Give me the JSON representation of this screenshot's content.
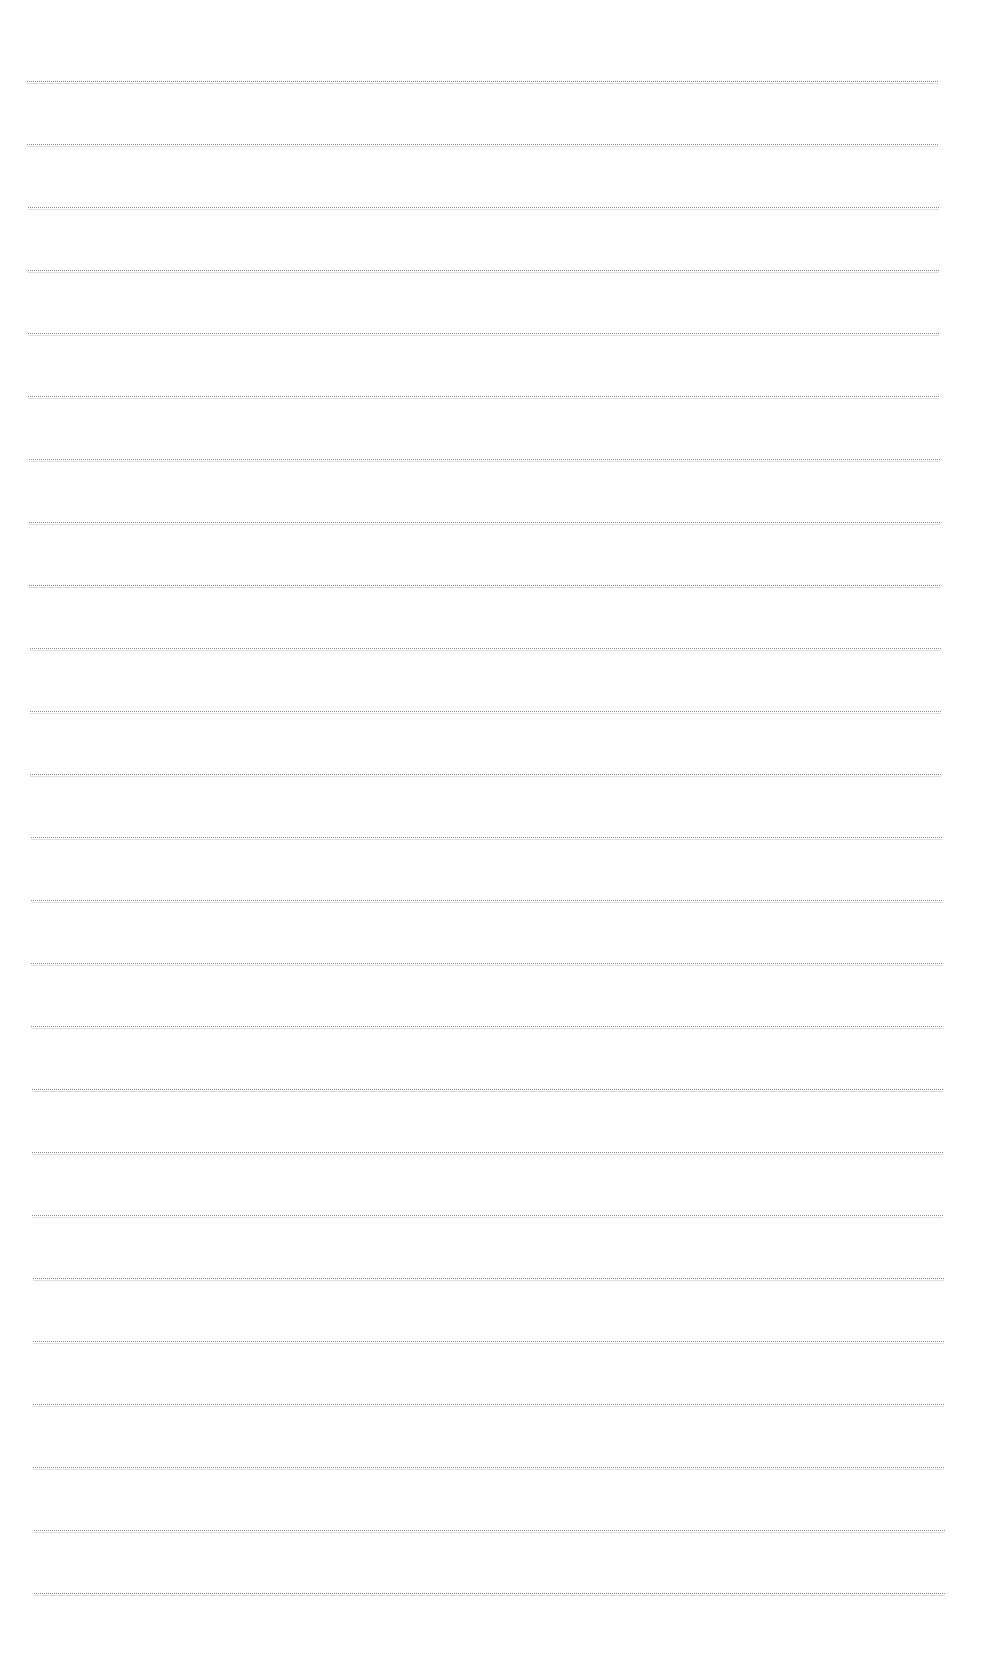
{
  "document": {
    "type": "ruled-paper",
    "rule_count": 25,
    "rule_color": "#8f8f8f",
    "background_color": "#fefefe",
    "rules": {
      "first_y": 81,
      "spacing": 63,
      "left_top": 27,
      "right_top": 938,
      "left_bottom": 34,
      "right_bottom": 945
    }
  }
}
